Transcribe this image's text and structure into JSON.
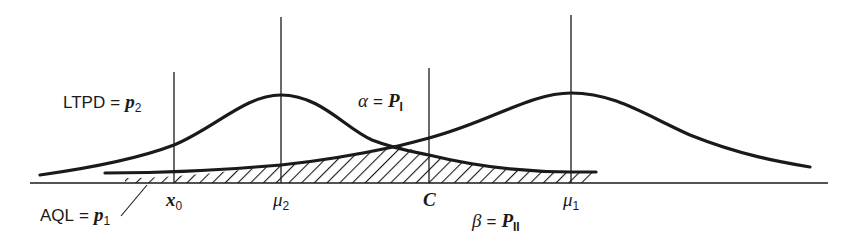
{
  "diagram": {
    "title": "",
    "colors": {
      "ink": "#1a1a1a",
      "background": "#ffffff"
    },
    "axis_ticks": {
      "x0": {
        "symbol": "x",
        "sub": "0"
      },
      "mu2": {
        "symbol": "μ",
        "sub": "2"
      },
      "c": {
        "symbol": "C"
      },
      "mu1": {
        "symbol": "μ",
        "sub": "1"
      }
    },
    "labels": {
      "ltpd": {
        "left": "LTPD",
        "eq": "=",
        "symbol": "p",
        "sub": "2"
      },
      "aql": {
        "left": "AQL",
        "eq": "=",
        "symbol": "p",
        "sub": "1"
      },
      "alpha": {
        "left": "α",
        "eq": "=",
        "symbol": "P",
        "sub": "I"
      },
      "beta": {
        "left": "β",
        "eq": "=",
        "symbol": "P",
        "sub": "II"
      }
    },
    "curves": [
      {
        "name": "distribution-centered-mu2",
        "peak_at": "μ2"
      },
      {
        "name": "distribution-centered-mu1",
        "peak_at": "μ1"
      }
    ],
    "shaded_region": "overlap tails (α and β error regions)"
  }
}
